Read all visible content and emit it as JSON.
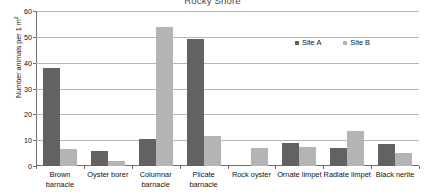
{
  "chart_data": {
    "type": "bar",
    "title": "Rocky Shore",
    "xlabel": "",
    "ylabel": "Number animals per 1 m²",
    "ylim": [
      0,
      60
    ],
    "ytick_step": 10,
    "yticks": [
      "0",
      "10",
      "20",
      "30",
      "40",
      "50",
      "60"
    ],
    "grid": true,
    "legend_position": "inside-top-right",
    "categories": [
      "Brown barnacle",
      "Oyster borer",
      "Columnar barnacle",
      "Plicate barnacle",
      "Rock oyster",
      "Ornate limpet",
      "Radiate limpet",
      "Black nerite"
    ],
    "series": [
      {
        "name": "Site A",
        "color": "#626262",
        "values": [
          38,
          6,
          10.5,
          49,
          0,
          9,
          7,
          8.5
        ]
      },
      {
        "name": "Site B",
        "color": "#b4b4b4",
        "values": [
          6.5,
          2,
          54,
          11.5,
          7,
          7.5,
          13.5,
          5
        ]
      }
    ]
  },
  "ylabel_parts": {
    "main": "Number animals per 1 m",
    "superscript": "2"
  }
}
